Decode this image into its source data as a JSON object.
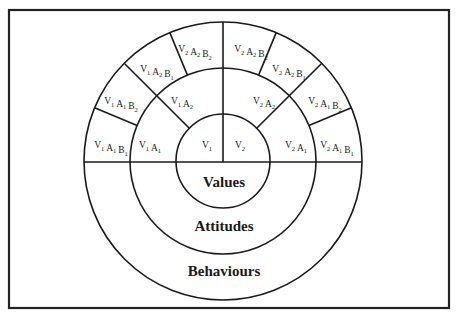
{
  "diagram": {
    "layers": {
      "inner": "Values",
      "middle": "Attitudes",
      "outer": "Behaviours"
    },
    "inner_segments": [
      {
        "id": "v1",
        "main": [
          "V",
          "1"
        ]
      },
      {
        "id": "v2",
        "main": [
          "V",
          "2"
        ]
      }
    ],
    "middle_segments": [
      {
        "id": "v1a1",
        "parts": [
          [
            "V",
            "1"
          ],
          [
            "A",
            "1"
          ]
        ]
      },
      {
        "id": "v1a2",
        "parts": [
          [
            "V",
            "1"
          ],
          [
            "A",
            "2"
          ]
        ]
      },
      {
        "id": "v2a2",
        "parts": [
          [
            "V",
            "2"
          ],
          [
            "A",
            "2"
          ]
        ]
      },
      {
        "id": "v2a1",
        "parts": [
          [
            "V",
            "2"
          ],
          [
            "A",
            "1"
          ]
        ]
      }
    ],
    "outer_segments": [
      {
        "id": "v1a1b1",
        "parts": [
          [
            "V",
            "1"
          ],
          [
            "A",
            "1"
          ],
          [
            "B",
            "1"
          ]
        ]
      },
      {
        "id": "v1a1b2",
        "parts": [
          [
            "V",
            "1"
          ],
          [
            "A",
            "1"
          ],
          [
            "B",
            "2"
          ]
        ]
      },
      {
        "id": "v1a2b1",
        "parts": [
          [
            "V",
            "1"
          ],
          [
            "A",
            "2"
          ],
          [
            "B",
            "1"
          ]
        ]
      },
      {
        "id": "v1a2b2",
        "parts": [
          [
            "V",
            "2"
          ],
          [
            "A",
            "2"
          ],
          [
            "B",
            "2"
          ]
        ]
      },
      {
        "id": "v2a2b2",
        "parts": [
          [
            "V",
            "2"
          ],
          [
            "A",
            "2"
          ],
          [
            "B",
            "2"
          ]
        ]
      },
      {
        "id": "v2a2b1",
        "parts": [
          [
            "V",
            "2"
          ],
          [
            "A",
            "2"
          ],
          [
            "B",
            "1"
          ]
        ]
      },
      {
        "id": "v2a1b2",
        "parts": [
          [
            "V",
            "2"
          ],
          [
            "A",
            "1"
          ],
          [
            "B",
            "2"
          ]
        ]
      },
      {
        "id": "v2a1b1",
        "parts": [
          [
            "V",
            "2"
          ],
          [
            "A",
            "1"
          ],
          [
            "B",
            "1"
          ]
        ]
      }
    ]
  },
  "colors": {
    "line": "#1a1a1a",
    "background": "#ffffff"
  }
}
